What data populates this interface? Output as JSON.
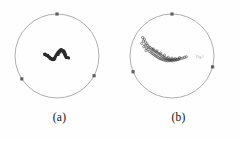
{
  "figure": {
    "background_color": "#fefefe",
    "circle_stroke_color": "#8d8d8d",
    "tick_color": "#4a4a4a",
    "marker_fill_color": "#2b2b2b",
    "marker_open_color": "#3a3a3a",
    "width": 239,
    "height": 141
  },
  "panels": [
    {
      "id": "a",
      "caption": "(a)",
      "center_x": 57,
      "center_y": 56,
      "radius": 42,
      "marker_style": "filled",
      "note": ""
    },
    {
      "id": "b",
      "caption": "(b)",
      "center_x": 53,
      "center_y": 56,
      "radius": 42,
      "marker_style": "open",
      "note": "Fig.1"
    }
  ],
  "chart_data": [
    {
      "type": "scatter",
      "title": "(a)",
      "projection": "stereonet",
      "xlabel": "",
      "ylabel": "",
      "xlim": [
        -1,
        1
      ],
      "ylim": [
        -1,
        1
      ],
      "grid": false,
      "legend": "none",
      "boundary_circle_radius": 1,
      "perimeter_ticks_deg": [
        118,
        0,
        237
      ],
      "series": [
        {
          "name": "cluster-a",
          "marker": "filled-square",
          "x": [
            -0.3,
            -0.28,
            -0.26,
            -0.25,
            -0.23,
            -0.22,
            -0.21,
            -0.19,
            -0.18,
            -0.17,
            -0.16,
            -0.15,
            -0.14,
            -0.13,
            -0.12,
            -0.11,
            -0.1,
            -0.09,
            -0.09,
            -0.08,
            -0.07,
            -0.06,
            -0.05,
            -0.04,
            -0.03,
            -0.02,
            -0.01,
            0.0,
            0.01,
            0.02,
            0.03,
            0.04,
            0.05,
            0.06,
            0.07,
            0.08,
            0.09,
            0.1,
            0.11,
            0.12,
            0.13,
            0.14,
            0.15,
            0.16,
            0.17,
            0.18,
            0.19,
            0.2,
            0.21,
            0.22,
            -0.27,
            -0.24,
            -0.2,
            -0.17,
            -0.14,
            -0.11,
            -0.08,
            -0.05,
            0.03,
            0.07,
            0.11,
            0.14,
            0.17,
            0.2,
            0.09,
            0.12,
            0.15,
            0.18,
            0.06,
            0.02,
            -0.29,
            -0.22,
            -0.15,
            0.04,
            0.1,
            0.16,
            0.21,
            0.24,
            0.26,
            0.28
          ],
          "y": [
            0.04,
            0.03,
            0.02,
            0.02,
            0.01,
            0.0,
            -0.01,
            -0.02,
            -0.03,
            -0.04,
            -0.05,
            -0.06,
            -0.06,
            -0.07,
            -0.08,
            -0.08,
            -0.09,
            -0.09,
            -0.08,
            -0.07,
            -0.06,
            -0.05,
            -0.04,
            -0.02,
            0.0,
            0.02,
            0.03,
            0.05,
            0.06,
            0.08,
            0.09,
            0.1,
            0.11,
            0.12,
            0.13,
            0.13,
            0.14,
            0.14,
            0.14,
            0.13,
            0.12,
            0.11,
            0.1,
            0.08,
            0.06,
            0.04,
            0.02,
            0.0,
            -0.02,
            -0.04,
            0.03,
            0.01,
            -0.02,
            -0.05,
            -0.07,
            -0.08,
            -0.09,
            -0.07,
            0.04,
            0.09,
            0.13,
            0.13,
            0.11,
            0.05,
            0.15,
            0.14,
            0.12,
            0.09,
            0.11,
            0.03,
            0.05,
            0.02,
            -0.06,
            0.07,
            0.15,
            0.12,
            0.01,
            -0.03,
            -0.04,
            -0.05
          ]
        }
      ]
    },
    {
      "type": "scatter",
      "title": "(b)",
      "projection": "stereonet",
      "xlabel": "",
      "ylabel": "",
      "xlim": [
        -1,
        1
      ],
      "ylim": [
        -1,
        1
      ],
      "grid": false,
      "legend": "none",
      "boundary_circle_radius": 1,
      "perimeter_ticks_deg": [
        105,
        0,
        248
      ],
      "series": [
        {
          "name": "cluster-b",
          "marker": "open-circle",
          "x": [
            -0.7,
            -0.66,
            -0.68,
            -0.63,
            -0.72,
            -0.6,
            -0.64,
            -0.58,
            -0.67,
            -0.55,
            -0.61,
            -0.52,
            -0.57,
            -0.49,
            -0.62,
            -0.46,
            -0.54,
            -0.43,
            -0.5,
            -0.4,
            -0.47,
            -0.37,
            -0.44,
            -0.34,
            -0.41,
            -0.31,
            -0.38,
            -0.28,
            -0.35,
            -0.25,
            -0.32,
            -0.22,
            -0.29,
            -0.19,
            -0.26,
            -0.16,
            -0.23,
            -0.13,
            -0.2,
            -0.1,
            -0.17,
            -0.07,
            -0.14,
            -0.04,
            -0.11,
            -0.01,
            -0.08,
            0.02,
            -0.05,
            0.05,
            -0.02,
            0.09,
            0.01,
            0.13,
            0.06,
            0.17,
            0.1,
            0.21,
            0.15,
            0.26,
            -0.45,
            -0.36,
            -0.27,
            -0.18,
            -0.09,
            0.0,
            0.08,
            0.18,
            0.3,
            0.34
          ],
          "y": [
            0.44,
            0.4,
            0.36,
            0.33,
            0.3,
            0.29,
            0.26,
            0.25,
            0.22,
            0.22,
            0.19,
            0.2,
            0.16,
            0.17,
            0.13,
            0.15,
            0.11,
            0.13,
            0.09,
            0.11,
            0.06,
            0.09,
            0.04,
            0.07,
            0.02,
            0.05,
            0.0,
            0.03,
            -0.02,
            0.01,
            -0.04,
            -0.01,
            -0.06,
            -0.03,
            -0.07,
            -0.05,
            -0.08,
            -0.06,
            -0.09,
            -0.07,
            -0.1,
            -0.08,
            -0.1,
            -0.08,
            -0.11,
            -0.09,
            -0.11,
            -0.09,
            -0.11,
            -0.09,
            -0.11,
            -0.09,
            -0.11,
            -0.08,
            -0.1,
            -0.07,
            -0.09,
            -0.06,
            -0.08,
            -0.05,
            0.17,
            0.12,
            0.07,
            0.02,
            -0.03,
            -0.05,
            -0.06,
            -0.04,
            -0.03,
            -0.02
          ]
        }
      ]
    }
  ]
}
